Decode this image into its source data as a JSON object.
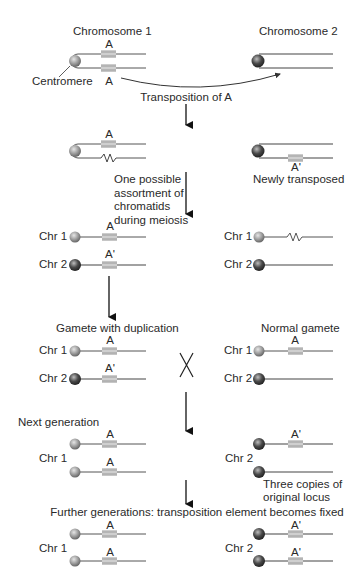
{
  "titles": {
    "chromosome1": "Chromosome 1",
    "chromosome2": "Chromosome 2",
    "centromere": "Centromere",
    "transposition": "Transposition of A"
  },
  "genes": {
    "a": "A",
    "a_prime": "A'"
  },
  "step2": {
    "newly_transposed": "Newly transposed",
    "assortment_note": "One possible\nassortment of\nchromatids\nduring meiosis"
  },
  "chr_labels": {
    "chr1": "Chr 1",
    "chr2": "Chr 2"
  },
  "step4": {
    "gamete_dup": "Gamete with duplication",
    "normal_gamete": "Normal gamete",
    "cross_symbol": "X"
  },
  "step5": {
    "next_generation": "Next generation",
    "three_copies": "Three copies of\noriginal locus"
  },
  "step6": {
    "further": "Further generations: transposition element becomes fixed"
  },
  "colors": {
    "line": "#555555",
    "chr1_centromere": "#9a9a9a",
    "chr2_centromere": "#4a4a4a",
    "gene_band": "#c8c8c8",
    "gene_band_dark": "#9e9e9e"
  }
}
